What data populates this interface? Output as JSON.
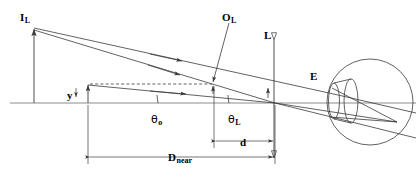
{
  "figure": {
    "type": "optics-ray-diagram",
    "width": 416,
    "height": 178,
    "background_color": "#ffffff",
    "line_color": "#3a3a3a",
    "text_color": "#000000"
  },
  "labels": {
    "image_point": {
      "main": "I",
      "sub": "L",
      "x": 20,
      "y": 8
    },
    "object_point": {
      "main": "O",
      "sub": "L",
      "x": 222,
      "y": 8
    },
    "lens_axis": {
      "main": "L",
      "sub": "",
      "x": 266,
      "y": 26
    },
    "eye": {
      "main": "E",
      "sub": "",
      "x": 310,
      "y": 68
    },
    "object_height": {
      "main": "y",
      "sub": "",
      "x": 68,
      "y": 86
    },
    "angle_object": {
      "main": "θ",
      "sub": "o",
      "x": 151,
      "y": 110
    },
    "angle_lens": {
      "main": "θ",
      "sub": "L",
      "x": 229,
      "y": 110
    },
    "distance_d": {
      "main": "d",
      "sub": "",
      "x": 240,
      "y": 131
    },
    "distance_near": {
      "main": "D",
      "sub": "near",
      "x": 169,
      "y": 148
    }
  },
  "dimensions": [
    {
      "name": "D_near",
      "label": "D near",
      "from_x": 88,
      "to_x": 275,
      "y": 157
    },
    {
      "name": "d",
      "label": "d",
      "from_x": 214,
      "to_x": 275,
      "y": 141
    }
  ],
  "geometry": {
    "optical_axis": {
      "x1": 10,
      "y1": 103,
      "x2": 416,
      "y2": 103
    },
    "lens_plane": {
      "x": 274,
      "y_top": 34,
      "y_bottom": 162
    },
    "image_arrow": {
      "x": 34,
      "y_tip": 28,
      "y_base": 103,
      "height_label": "I_L"
    },
    "object_arrow": {
      "x": 88,
      "y_tip": 85,
      "y_base": 103,
      "height_label": "y"
    },
    "eye_circle": {
      "cx": 370,
      "cy": 102,
      "r": 43
    },
    "cornea_front": {
      "cx": 336,
      "cy": 101,
      "rx": 6,
      "ry": 19
    },
    "cornea_back": {
      "cx": 352,
      "cy": 101,
      "rx": 7,
      "ry": 22
    },
    "retina_point": {
      "x": 397,
      "y": 122
    },
    "angle_arc_object": {
      "cx": 275,
      "cy": 103,
      "r": 118
    },
    "angle_arc_lens": {
      "cx": 275,
      "cy": 103,
      "r": 46
    }
  },
  "rays": {
    "from_image_upper": {
      "x1": 34,
      "y1": 29,
      "x2": 336,
      "y2": 96
    },
    "from_image_lower": {
      "x1": 34,
      "y1": 31,
      "x2": 275,
      "y2": 103
    },
    "from_object": {
      "x1": 88,
      "y1": 86,
      "x2": 275,
      "y2": 103
    },
    "refracted_upper": {
      "x1": 336,
      "y1": 96,
      "x2": 397,
      "y2": 122
    },
    "refracted_lower": {
      "x1": 336,
      "y1": 112,
      "x2": 397,
      "y2": 122
    },
    "through_center": {
      "x1": 275,
      "y1": 103,
      "x2": 416,
      "y2": 137
    }
  },
  "annotations": {
    "dashed_construction_line": {
      "x1": 90,
      "y1": 84,
      "x2": 213,
      "y2": 84
    },
    "leader_to_object_point": {
      "x1": 228,
      "y1": 22,
      "x2": 212,
      "y2": 83
    }
  }
}
